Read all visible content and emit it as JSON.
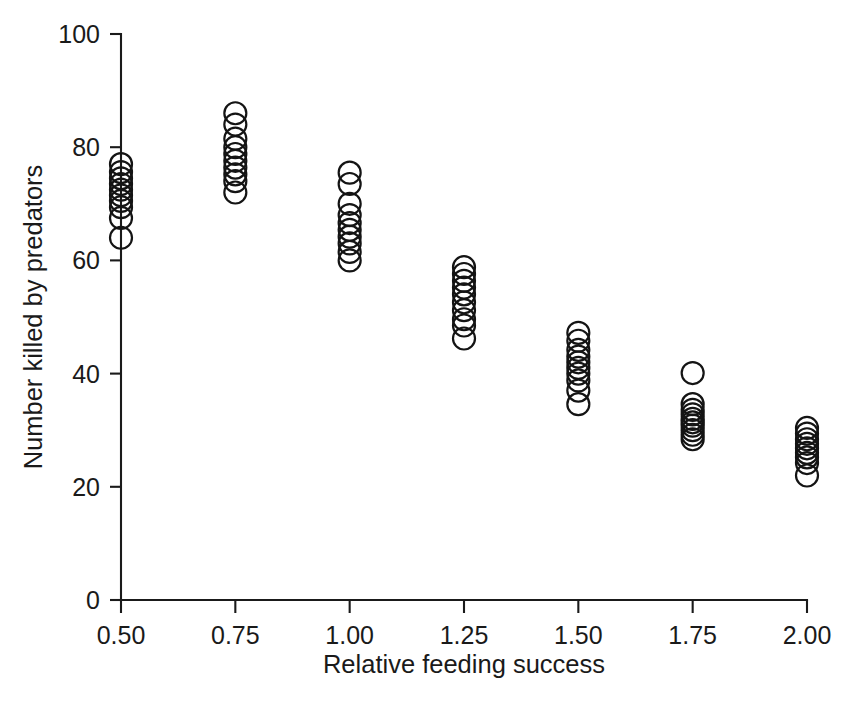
{
  "chart_data": {
    "type": "scatter",
    "title": "",
    "xlabel": "Relative feeding success",
    "ylabel": "Number killed by predators",
    "xlim": [
      0.4375,
      2.0625
    ],
    "ylim": [
      0,
      100
    ],
    "xticks": [
      0.5,
      0.75,
      1.0,
      1.25,
      1.5,
      1.75,
      2.0
    ],
    "xticklabels": [
      "0.50",
      "0.75",
      "1.00",
      "1.25",
      "1.50",
      "1.75",
      "2.00"
    ],
    "yticks": [
      0,
      20,
      40,
      60,
      80,
      100
    ],
    "yticklabels": [
      "0",
      "20",
      "40",
      "60",
      "80",
      "100"
    ],
    "grid": false,
    "legend": null,
    "marker": {
      "shape": "circle",
      "filled": false,
      "edge_color": "#141414",
      "face_color": "none",
      "size_px": 22,
      "line_width": 2.2
    },
    "axis_color": "#1a1a1a",
    "background_color": "#ffffff",
    "spines": [
      "left",
      "bottom"
    ],
    "groups": [
      {
        "x": 0.5,
        "y": [
          77.0,
          75.6,
          74.5,
          73.5,
          72.5,
          71.5,
          70.5,
          69.4,
          67.5,
          64.0
        ]
      },
      {
        "x": 0.75,
        "y": [
          86.0,
          84.0,
          81.5,
          80.0,
          78.8,
          77.6,
          76.4,
          75.2,
          74.0,
          72.0
        ]
      },
      {
        "x": 1.0,
        "y": [
          75.5,
          73.5,
          70.0,
          68.0,
          66.6,
          65.4,
          64.2,
          63.0,
          61.5,
          60.0
        ]
      },
      {
        "x": 1.25,
        "y": [
          58.8,
          57.6,
          56.4,
          55.2,
          54.0,
          52.6,
          51.2,
          49.6,
          48.5,
          46.2
        ]
      },
      {
        "x": 1.5,
        "y": [
          47.2,
          45.8,
          44.2,
          43.0,
          42.0,
          41.0,
          40.0,
          38.8,
          37.0,
          34.6
        ]
      },
      {
        "x": 1.75,
        "y": [
          40.1,
          34.6,
          33.6,
          32.8,
          32.0,
          31.4,
          30.8,
          30.0,
          29.2,
          28.4
        ]
      },
      {
        "x": 2.0,
        "y": [
          30.4,
          29.4,
          28.4,
          27.6,
          26.8,
          26.0,
          25.2,
          24.2,
          22.0
        ]
      }
    ],
    "series": [
      {
        "name": "observations",
        "x": [
          0.5,
          0.5,
          0.5,
          0.5,
          0.5,
          0.5,
          0.5,
          0.5,
          0.5,
          0.5,
          0.75,
          0.75,
          0.75,
          0.75,
          0.75,
          0.75,
          0.75,
          0.75,
          0.75,
          0.75,
          1.0,
          1.0,
          1.0,
          1.0,
          1.0,
          1.0,
          1.0,
          1.0,
          1.0,
          1.0,
          1.25,
          1.25,
          1.25,
          1.25,
          1.25,
          1.25,
          1.25,
          1.25,
          1.25,
          1.25,
          1.5,
          1.5,
          1.5,
          1.5,
          1.5,
          1.5,
          1.5,
          1.5,
          1.5,
          1.5,
          1.75,
          1.75,
          1.75,
          1.75,
          1.75,
          1.75,
          1.75,
          1.75,
          1.75,
          1.75,
          2.0,
          2.0,
          2.0,
          2.0,
          2.0,
          2.0,
          2.0,
          2.0,
          2.0
        ],
        "y": [
          77.0,
          75.6,
          74.5,
          73.5,
          72.5,
          71.5,
          70.5,
          69.4,
          67.5,
          64.0,
          86.0,
          84.0,
          81.5,
          80.0,
          78.8,
          77.6,
          76.4,
          75.2,
          74.0,
          72.0,
          75.5,
          73.5,
          70.0,
          68.0,
          66.6,
          65.4,
          64.2,
          63.0,
          61.5,
          60.0,
          58.8,
          57.6,
          56.4,
          55.2,
          54.0,
          52.6,
          51.2,
          49.6,
          48.5,
          46.2,
          47.2,
          45.8,
          44.2,
          43.0,
          42.0,
          41.0,
          40.0,
          38.8,
          37.0,
          34.6,
          40.1,
          34.6,
          33.6,
          32.8,
          32.0,
          31.4,
          30.8,
          30.0,
          29.2,
          28.4,
          30.4,
          29.4,
          28.4,
          27.6,
          26.8,
          26.0,
          25.2,
          24.2,
          22.0
        ]
      }
    ]
  },
  "geometry": {
    "x_axis_y_px": 600,
    "y_axis_x_px": 121,
    "y_top_px": 34,
    "x_right_px": 807,
    "px_per_unit_y": 5.66,
    "px_per_xtick": 114
  }
}
